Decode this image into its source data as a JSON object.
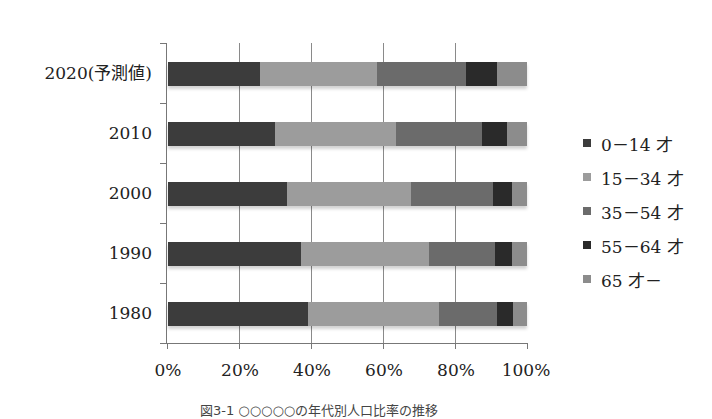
{
  "chart_data": {
    "type": "bar",
    "orientation": "horizontal",
    "stacked": "percent",
    "title": "",
    "caption": "図3-1 ○○○○○の年代別人口比率の推移",
    "xlabel": "",
    "ylabel": "",
    "xlim": [
      0,
      100
    ],
    "x_ticks": [
      "0%",
      "20%",
      "40%",
      "60%",
      "80%",
      "100%"
    ],
    "grid": true,
    "legend_position": "right",
    "categories": [
      "2020(予測値)",
      "2010",
      "2000",
      "1990",
      "1980"
    ],
    "series": [
      {
        "name": "0－14 才",
        "color": "#3c3c3c",
        "values": [
          25.6,
          29.8,
          33.1,
          37.0,
          39.0
        ]
      },
      {
        "name": "15－34 才",
        "color": "#9c9c9c",
        "values": [
          32.6,
          33.7,
          34.5,
          35.7,
          36.5
        ]
      },
      {
        "name": "35－54 才",
        "color": "#6b6b6b",
        "values": [
          24.8,
          24.0,
          23.0,
          18.4,
          16.1
        ]
      },
      {
        "name": "55－64 才",
        "color": "#2a2a2a",
        "values": [
          8.6,
          6.9,
          5.2,
          4.7,
          4.5
        ]
      },
      {
        "name": "65 才－",
        "color": "#8c8c8c",
        "values": [
          8.4,
          5.6,
          4.2,
          4.2,
          3.9
        ]
      }
    ]
  },
  "legend": [
    {
      "label": "0－14 才",
      "color": "#3c3c3c"
    },
    {
      "label": "15－34 才",
      "color": "#9c9c9c"
    },
    {
      "label": "35－54 才",
      "color": "#6b6b6b"
    },
    {
      "label": "55－64 才",
      "color": "#2a2a2a"
    },
    {
      "label": "65 才－",
      "color": "#8c8c8c"
    }
  ],
  "axis": {
    "x_ticks": [
      "0%",
      "20%",
      "40%",
      "60%",
      "80%",
      "100%"
    ],
    "y_labels": [
      "2020(予測値)",
      "2010",
      "2000",
      "1990",
      "1980"
    ]
  },
  "caption": "図3-1 ○○○○○の年代別人口比率の推移"
}
